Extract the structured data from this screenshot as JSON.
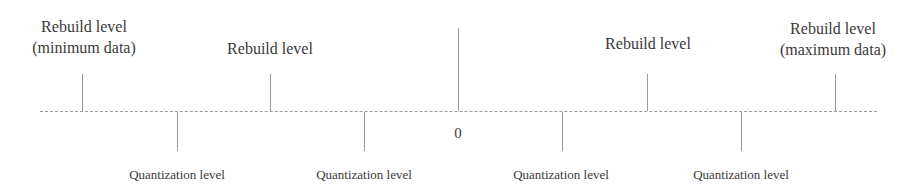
{
  "diagram": {
    "type": "quantization-number-line",
    "zero_label": "0",
    "rebuild_levels": [
      {
        "line1": "Rebuild level",
        "line2": "(minimum data)",
        "x": 82
      },
      {
        "line1": "Rebuild level",
        "line2": "",
        "x": 270
      },
      {
        "line1": "Rebuild level",
        "line2": "",
        "x": 647
      },
      {
        "line1": "Rebuild level",
        "line2": "(maximum data)",
        "x": 835
      }
    ],
    "quantization_levels": [
      {
        "label": "Quantization level",
        "x": 177
      },
      {
        "label": "Quantization level",
        "x": 364
      },
      {
        "label": "Quantization level",
        "x": 562
      },
      {
        "label": "Quantization level",
        "x": 741
      }
    ],
    "zero_x": 458,
    "colors": {
      "text": "#3a3a3a",
      "lines": "#9a9a9a",
      "background": "#ffffff"
    }
  }
}
